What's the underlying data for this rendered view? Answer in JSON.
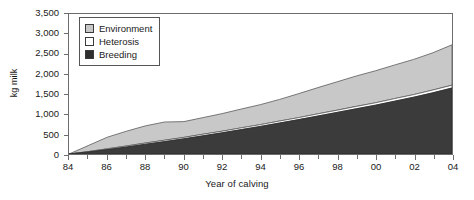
{
  "chart_data": {
    "type": "area",
    "stacked": true,
    "title": "",
    "subtitle": "",
    "xlabel": "Year of calving",
    "ylabel": "kg milk",
    "xlim": [
      1984,
      2004
    ],
    "ylim": [
      0,
      3500
    ],
    "grid": false,
    "legend_position": "top-left",
    "x": [
      1984,
      1985,
      1986,
      1987,
      1988,
      1989,
      1990,
      1991,
      1992,
      1993,
      1994,
      1995,
      1996,
      1997,
      1998,
      1999,
      2000,
      2001,
      2002,
      2003,
      2004
    ],
    "xtick_labels": [
      "84",
      "86",
      "88",
      "90",
      "92",
      "94",
      "96",
      "98",
      "00",
      "02",
      "04"
    ],
    "ytick_labels": [
      "0",
      "500",
      "1,000",
      "1,500",
      "2,000",
      "2,500",
      "3,000",
      "3,500"
    ],
    "ytick_values": [
      0,
      500,
      1000,
      1500,
      2000,
      2500,
      3000,
      3500
    ],
    "series": [
      {
        "name": "Breeding",
        "color": "#3b3b3b",
        "values": [
          0,
          50,
          110,
          175,
          245,
          310,
          380,
          455,
          530,
          610,
          690,
          775,
          860,
          950,
          1040,
          1130,
          1220,
          1320,
          1420,
          1530,
          1650
        ]
      },
      {
        "name": "Heterosis",
        "color": "#ffffff",
        "values": [
          0,
          10,
          20,
          25,
          30,
          35,
          35,
          40,
          40,
          45,
          45,
          50,
          50,
          55,
          55,
          60,
          60,
          65,
          65,
          70,
          70
        ]
      },
      {
        "name": "Environment",
        "color": "#c8c8c8",
        "values": [
          0,
          150,
          290,
          370,
          430,
          455,
          395,
          415,
          440,
          470,
          500,
          540,
          600,
          655,
          710,
          760,
          800,
          840,
          880,
          930,
          1010
        ]
      }
    ],
    "cumulative_totals": [
      0,
      210,
      420,
      570,
      705,
      800,
      810,
      910,
      1010,
      1125,
      1235,
      1365,
      1510,
      1660,
      1805,
      1950,
      2080,
      2225,
      2365,
      2530,
      2730
    ]
  },
  "legend": {
    "items": [
      {
        "label": "Environment",
        "swatch": "#c8c8c8"
      },
      {
        "label": "Heterosis",
        "swatch": "#ffffff"
      },
      {
        "label": "Breeding",
        "swatch": "#2e2e2e"
      }
    ]
  },
  "axes": {
    "y_title": "kg milk",
    "x_title": "Year of calving"
  }
}
